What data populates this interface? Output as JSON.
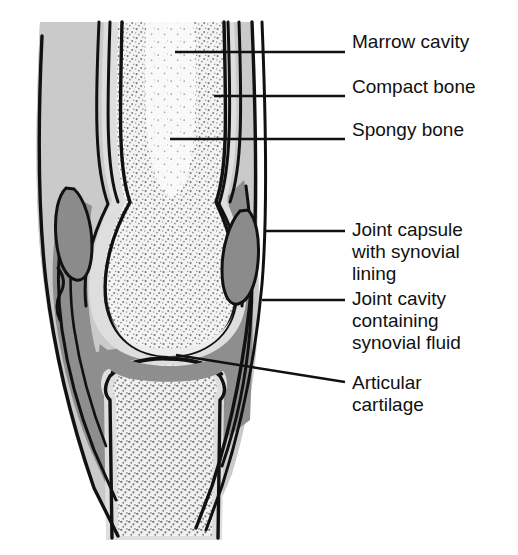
{
  "figure": {
    "type": "anatomical-illustration",
    "background_color": "#ffffff"
  },
  "colors": {
    "outline": "#111111",
    "capsule_gray": "#c9c9c9",
    "joint_cavity_gray": "#8f8f8f",
    "spongy_bone_fill": "#f2f2f2",
    "marrow_fill": "#fbfbfb",
    "compact_bone_fill": "#dcdcdc",
    "stipple_dot": "#7a7a7a",
    "text": "#111111"
  },
  "labels": [
    {
      "id": "marrow-cavity",
      "lines": [
        "Marrow cavity"
      ],
      "text_x": 352,
      "text_y": 48,
      "leader": {
        "type": "straight",
        "x1": 175,
        "y1": 52,
        "x2": 345,
        "y2": 52
      }
    },
    {
      "id": "compact-bone",
      "lines": [
        "Compact bone"
      ],
      "text_x": 352,
      "text_y": 93,
      "leader": {
        "type": "straight",
        "x1": 214,
        "y1": 96,
        "x2": 345,
        "y2": 96
      }
    },
    {
      "id": "spongy-bone",
      "lines": [
        "Spongy bone"
      ],
      "text_x": 352,
      "text_y": 136,
      "leader": {
        "type": "straight",
        "x1": 170,
        "y1": 139,
        "x2": 345,
        "y2": 139
      }
    },
    {
      "id": "joint-capsule-with-synovial-lining",
      "lines": [
        "Joint capsule",
        "with synovial",
        "lining"
      ],
      "text_x": 352,
      "text_y": 236,
      "line_height": 22,
      "leader": {
        "type": "straight",
        "x1": 266,
        "y1": 231,
        "x2": 345,
        "y2": 231
      }
    },
    {
      "id": "joint-cavity-containing-synovial-fluid",
      "lines": [
        "Joint cavity",
        "containing",
        "synovial fluid"
      ],
      "text_x": 352,
      "text_y": 305,
      "line_height": 22,
      "leader": {
        "type": "straight",
        "x1": 262,
        "y1": 300,
        "x2": 345,
        "y2": 300
      }
    },
    {
      "id": "articular-cartilage",
      "lines": [
        "Articular",
        "cartilage"
      ],
      "text_x": 352,
      "text_y": 389,
      "line_height": 22,
      "leader": {
        "type": "diagonal",
        "x1": 176,
        "y1": 355,
        "x2": 345,
        "y2": 382
      }
    }
  ],
  "structures": [
    {
      "id": "marrow-cavity",
      "name": "Marrow cavity",
      "description": "Light central channel in the upper femoral shaft"
    },
    {
      "id": "compact-bone",
      "name": "Compact bone",
      "description": "Dense cortical shell lines along the shaft"
    },
    {
      "id": "spongy-bone",
      "name": "Spongy bone",
      "description": "Stippled trabecular bone filling the epiphyses"
    },
    {
      "id": "joint-capsule",
      "name": "Joint capsule with synovial lining",
      "description": "Light gray fibrous sleeve enclosing the joint"
    },
    {
      "id": "joint-cavity",
      "name": "Joint cavity containing synovial fluid",
      "description": "Dark gray space between articulating bone ends"
    },
    {
      "id": "articular-cartilage",
      "name": "Articular cartilage",
      "description": "Thin smooth layer capping the bone ends"
    }
  ]
}
